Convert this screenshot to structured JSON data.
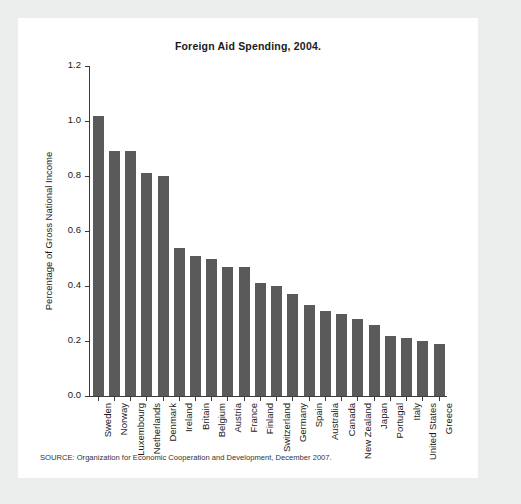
{
  "panel": {
    "background": "#ffffff",
    "page_background": "#eceded"
  },
  "source_note": "SOURCE: Organization for Economic Cooperation and Development, December 2007.",
  "chart_data": {
    "type": "bar",
    "title": "Foreign Aid Spending, 2004.",
    "xlabel": "",
    "ylabel": "Percentage of Gross National Income",
    "ylim": [
      0.0,
      1.2
    ],
    "yticks": [
      "0.0",
      "0.2",
      "0.4",
      "0.6",
      "0.8",
      "1.0",
      "1.2"
    ],
    "ytick_values": [
      0.0,
      0.2,
      0.4,
      0.6,
      0.8,
      1.0,
      1.2
    ],
    "grid": false,
    "legend": null,
    "bar_color": "#5a5a5a",
    "axis_color": "#3b3b3b",
    "categories": [
      "Sweden",
      "Norway",
      "Luxembourg",
      "Netherlands",
      "Denmark",
      "Ireland",
      "Britain",
      "Belgium",
      "Austria",
      "France",
      "Finland",
      "Switzerland",
      "Germany",
      "Spain",
      "Australia",
      "Canada",
      "New Zealand",
      "Japan",
      "Portugal",
      "Italy",
      "United States",
      "Greece"
    ],
    "values": [
      1.02,
      0.89,
      0.89,
      0.81,
      0.8,
      0.54,
      0.51,
      0.5,
      0.47,
      0.47,
      0.41,
      0.4,
      0.37,
      0.33,
      0.31,
      0.3,
      0.28,
      0.26,
      0.22,
      0.21,
      0.2,
      0.19
    ]
  }
}
